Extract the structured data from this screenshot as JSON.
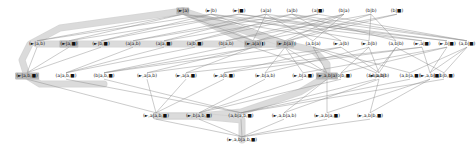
{
  "diagram": {
    "type": "hasse-lattice",
    "title": "",
    "node_style": {
      "highlight_color": "#b9b9b9",
      "edge_color": "#8a8a8a",
      "path_color": "#d0d0d0"
    },
    "levels": [
      {
        "index": 0,
        "y": 11,
        "nodes": [
          {
            "id": "L0N0",
            "label": "(►|a)",
            "x": 183,
            "highlight": "strong"
          },
          {
            "id": "L0N1",
            "label": "(►|b)",
            "x": 211,
            "highlight": "none"
          },
          {
            "id": "L0N2",
            "label": "(►|■)",
            "x": 239,
            "highlight": "none"
          },
          {
            "id": "L0N3",
            "label": "(a|a)",
            "x": 266,
            "highlight": "none"
          },
          {
            "id": "L0N4",
            "label": "(a|b)",
            "x": 292,
            "highlight": "none"
          },
          {
            "id": "L0N5",
            "label": "(a|■)",
            "x": 318,
            "highlight": "none"
          },
          {
            "id": "L0N6",
            "label": "(b|a)",
            "x": 344,
            "highlight": "none"
          },
          {
            "id": "L0N7",
            "label": "(b|b)",
            "x": 371,
            "highlight": "none"
          },
          {
            "id": "L0N8",
            "label": "(b|■)",
            "x": 397,
            "highlight": "none"
          }
        ]
      },
      {
        "index": 1,
        "y": 44,
        "nodes": [
          {
            "id": "L1N0",
            "label": "(►|a,b)",
            "x": 37,
            "highlight": "none"
          },
          {
            "id": "L1N1",
            "label": "(►|a,■)",
            "x": 69,
            "highlight": "strong"
          },
          {
            "id": "L1N2",
            "label": "(►|b,■)",
            "x": 101,
            "highlight": "none"
          },
          {
            "id": "L1N3",
            "label": "(a|a,b)",
            "x": 133,
            "highlight": "none"
          },
          {
            "id": "L1N4",
            "label": "(a|a,■)",
            "x": 164,
            "highlight": "none"
          },
          {
            "id": "L1N5",
            "label": "(a|b,■)",
            "x": 195,
            "highlight": "none"
          },
          {
            "id": "L1N6",
            "label": "(b|a,b)",
            "x": 226,
            "highlight": "none"
          },
          {
            "id": "L1N7",
            "label": "(b|a,■)",
            "x": 257,
            "highlight": "none"
          },
          {
            "id": "L1N8",
            "label": "(b|b,■)",
            "x": 288,
            "highlight": "none"
          },
          {
            "id": "L1N9",
            "label": "(►,a|a)",
            "x": 253,
            "highlight": "strong"
          },
          {
            "id": "L1N10",
            "label": "(►,b|a)",
            "x": 285,
            "highlight": "strong"
          },
          {
            "id": "L1N11",
            "label": "(a,b|a)",
            "x": 313,
            "highlight": "none"
          },
          {
            "id": "L1N12",
            "label": "(►,a|b)",
            "x": 341,
            "highlight": "none"
          },
          {
            "id": "L1N13",
            "label": "(►,b|b)",
            "x": 369,
            "highlight": "none"
          },
          {
            "id": "L1N14",
            "label": "(a,b|b)",
            "x": 396,
            "highlight": "none"
          },
          {
            "id": "L1N15",
            "label": "(►,a|■)",
            "x": 422,
            "highlight": "none"
          },
          {
            "id": "L1N16",
            "label": "(►,b|■)",
            "x": 447,
            "highlight": "none"
          },
          {
            "id": "L1N17",
            "label": "(a,b|■)",
            "x": 467,
            "highlight": "none"
          }
        ]
      },
      {
        "index": 2,
        "y": 76,
        "nodes": [
          {
            "id": "L2N0",
            "label": "(►|a,b,■)",
            "x": 27,
            "highlight": "strong"
          },
          {
            "id": "L2N1",
            "label": "(a|a,b,■)",
            "x": 66,
            "highlight": "none"
          },
          {
            "id": "L2N2",
            "label": "(b|a,b,■)",
            "x": 104,
            "highlight": "none"
          },
          {
            "id": "L2N3",
            "label": "(►,a|a,b)",
            "x": 147,
            "highlight": "none"
          },
          {
            "id": "L2N4",
            "label": "(►,a|a,■)",
            "x": 186,
            "highlight": "none"
          },
          {
            "id": "L2N5",
            "label": "(►,a|b,■)",
            "x": 224,
            "highlight": "none"
          },
          {
            "id": "L2N6",
            "label": "(►,b|a,b)",
            "x": 265,
            "highlight": "none"
          },
          {
            "id": "L2N7",
            "label": "(►,b|a,■)",
            "x": 303,
            "highlight": "none"
          },
          {
            "id": "L2N8",
            "label": "(►,b|b,■)",
            "x": 341,
            "highlight": "none"
          },
          {
            "id": "L2N9",
            "label": "(a,b|a,b)",
            "x": 376,
            "highlight": "none"
          },
          {
            "id": "L2N10",
            "label": "(a,b|a,■)",
            "x": 410,
            "highlight": "none"
          },
          {
            "id": "L2N11",
            "label": "(a,b|b,■)",
            "x": 444,
            "highlight": "none"
          },
          {
            "id": "L2N12",
            "label": "(►,a,b|a)",
            "x": 327,
            "highlight": "strong"
          },
          {
            "id": "L2N13",
            "label": "(►,a,b|b)",
            "x": 379,
            "highlight": "none"
          },
          {
            "id": "L2N14",
            "label": "(►,a,b|■)",
            "x": 430,
            "highlight": "none"
          }
        ]
      },
      {
        "index": 3,
        "y": 116,
        "nodes": [
          {
            "id": "L3N0",
            "label": "(►,a|a,b,■)",
            "x": 156,
            "highlight": "none"
          },
          {
            "id": "L3N1",
            "label": "(►,b|a,b,■)",
            "x": 199,
            "highlight": "none"
          },
          {
            "id": "L3N2",
            "label": "(a,b|a,b,■)",
            "x": 241,
            "highlight": "none"
          },
          {
            "id": "L3N3",
            "label": "(►,a,b|a,b)",
            "x": 284,
            "highlight": "none"
          },
          {
            "id": "L3N4",
            "label": "(►,a,b|a,■)",
            "x": 327,
            "highlight": "none"
          },
          {
            "id": "L3N5",
            "label": "(►,a,b|b,■)",
            "x": 370,
            "highlight": "none"
          }
        ]
      },
      {
        "index": 4,
        "y": 140,
        "nodes": [
          {
            "id": "L4N0",
            "label": "(►,a,b|a,b,■)",
            "x": 242,
            "highlight": "none"
          }
        ]
      }
    ],
    "edges": [
      [
        "L0N0",
        "L1N0"
      ],
      [
        "L0N0",
        "L1N1"
      ],
      [
        "L0N0",
        "L1N9"
      ],
      [
        "L0N0",
        "L1N12"
      ],
      [
        "L0N0",
        "L1N15"
      ],
      [
        "L0N1",
        "L1N0"
      ],
      [
        "L0N1",
        "L1N2"
      ],
      [
        "L0N1",
        "L1N10"
      ],
      [
        "L0N1",
        "L1N13"
      ],
      [
        "L0N1",
        "L1N16"
      ],
      [
        "L0N2",
        "L1N1"
      ],
      [
        "L0N2",
        "L1N2"
      ],
      [
        "L0N2",
        "L1N15"
      ],
      [
        "L0N2",
        "L1N16"
      ],
      [
        "L0N3",
        "L1N3"
      ],
      [
        "L0N3",
        "L1N4"
      ],
      [
        "L0N3",
        "L1N9"
      ],
      [
        "L0N3",
        "L1N11"
      ],
      [
        "L0N3",
        "L1N17"
      ],
      [
        "L0N4",
        "L1N3"
      ],
      [
        "L0N4",
        "L1N5"
      ],
      [
        "L0N4",
        "L1N12"
      ],
      [
        "L0N4",
        "L1N14"
      ],
      [
        "L0N4",
        "L1N17"
      ],
      [
        "L0N5",
        "L1N4"
      ],
      [
        "L0N5",
        "L1N5"
      ],
      [
        "L0N5",
        "L1N17"
      ],
      [
        "L0N6",
        "L1N6"
      ],
      [
        "L0N6",
        "L1N7"
      ],
      [
        "L0N6",
        "L1N10"
      ],
      [
        "L0N6",
        "L1N11"
      ],
      [
        "L0N7",
        "L1N6"
      ],
      [
        "L0N7",
        "L1N8"
      ],
      [
        "L0N7",
        "L1N13"
      ],
      [
        "L0N7",
        "L1N14"
      ],
      [
        "L0N8",
        "L1N7"
      ],
      [
        "L0N8",
        "L1N8"
      ],
      [
        "L1N0",
        "L2N0"
      ],
      [
        "L1N1",
        "L2N0"
      ],
      [
        "L1N2",
        "L2N0"
      ],
      [
        "L1N3",
        "L2N1"
      ],
      [
        "L1N4",
        "L2N1"
      ],
      [
        "L1N5",
        "L2N1"
      ],
      [
        "L1N6",
        "L2N2"
      ],
      [
        "L1N7",
        "L2N2"
      ],
      [
        "L1N8",
        "L2N2"
      ],
      [
        "L1N9",
        "L2N3"
      ],
      [
        "L1N9",
        "L2N4"
      ],
      [
        "L1N9",
        "L2N12"
      ],
      [
        "L1N10",
        "L2N6"
      ],
      [
        "L1N10",
        "L2N7"
      ],
      [
        "L1N10",
        "L2N12"
      ],
      [
        "L1N11",
        "L2N9"
      ],
      [
        "L1N11",
        "L2N10"
      ],
      [
        "L1N11",
        "L2N12"
      ],
      [
        "L1N12",
        "L2N3"
      ],
      [
        "L1N12",
        "L2N5"
      ],
      [
        "L1N12",
        "L2N13"
      ],
      [
        "L1N13",
        "L2N6"
      ],
      [
        "L1N13",
        "L2N8"
      ],
      [
        "L1N13",
        "L2N13"
      ],
      [
        "L1N14",
        "L2N9"
      ],
      [
        "L1N14",
        "L2N11"
      ],
      [
        "L1N14",
        "L2N13"
      ],
      [
        "L1N15",
        "L2N4"
      ],
      [
        "L1N15",
        "L2N5"
      ],
      [
        "L1N15",
        "L2N14"
      ],
      [
        "L1N16",
        "L2N7"
      ],
      [
        "L1N16",
        "L2N8"
      ],
      [
        "L1N16",
        "L2N14"
      ],
      [
        "L1N17",
        "L2N10"
      ],
      [
        "L1N17",
        "L2N11"
      ],
      [
        "L1N17",
        "L2N14"
      ],
      [
        "L2N3",
        "L3N0"
      ],
      [
        "L2N4",
        "L3N0"
      ],
      [
        "L2N5",
        "L3N0"
      ],
      [
        "L2N6",
        "L3N1"
      ],
      [
        "L2N7",
        "L3N1"
      ],
      [
        "L2N8",
        "L3N1"
      ],
      [
        "L2N9",
        "L3N2"
      ],
      [
        "L2N10",
        "L3N2"
      ],
      [
        "L2N11",
        "L3N2"
      ],
      [
        "L2N12",
        "L3N3"
      ],
      [
        "L2N12",
        "L3N4"
      ],
      [
        "L2N13",
        "L3N3"
      ],
      [
        "L2N13",
        "L3N5"
      ],
      [
        "L2N14",
        "L3N4"
      ],
      [
        "L2N14",
        "L3N5"
      ],
      [
        "L2N0",
        "L3N0"
      ],
      [
        "L2N1",
        "L3N2"
      ],
      [
        "L2N2",
        "L3N2"
      ],
      [
        "L3N0",
        "L4N0"
      ],
      [
        "L3N1",
        "L4N0"
      ],
      [
        "L3N2",
        "L4N0"
      ],
      [
        "L3N3",
        "L4N0"
      ],
      [
        "L3N4",
        "L4N0"
      ],
      [
        "L3N5",
        "L4N0"
      ]
    ],
    "highlight_paths": [
      {
        "id": "hp-left",
        "points": "183,11 60,28 30,44 22,60 27,76 40,84 66,84 104,84"
      },
      {
        "id": "hp-row1",
        "points": "37,44 69,44 101,44 133,44 164,44 195,44 226,44 288,44"
      },
      {
        "id": "hp-mid",
        "points": "253,44 285,44 313,50 327,64 327,76 300,92 241,112 200,116 156,116"
      },
      {
        "id": "hp-lower",
        "points": "156,116 199,116 242,120 242,140"
      },
      {
        "id": "hp-diag",
        "points": "183,11 253,44"
      },
      {
        "id": "hp-diag2",
        "points": "183,11 285,44"
      }
    ]
  }
}
